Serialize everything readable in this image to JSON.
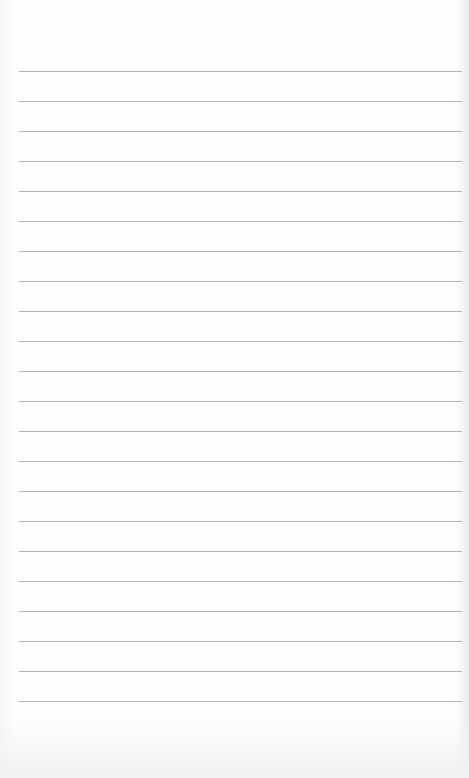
{
  "document": {
    "type": "lined-paper",
    "header_text": "",
    "rule_count": 22,
    "rule_start_y": 71,
    "rule_spacing": 30,
    "colors": {
      "paper": "#fefefe",
      "rule": "#b4b4b4"
    }
  }
}
